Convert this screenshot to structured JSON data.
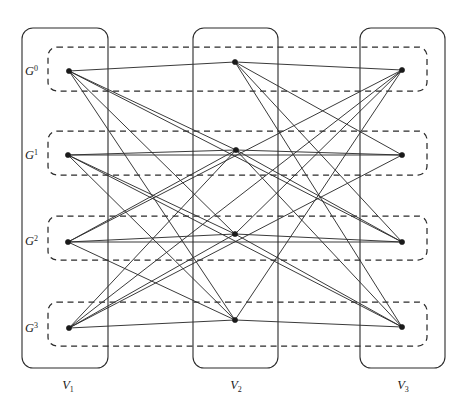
{
  "figure": {
    "width": 471,
    "height": 414,
    "background": "#ffffff",
    "stroke_color": "#2b2b2b",
    "edge_color": "#2f2f2f",
    "node_color": "#1a1a1a"
  },
  "columns": [
    {
      "id": "V1",
      "label": "V",
      "sub": "1",
      "x": 22,
      "y": 28,
      "w": 86,
      "h": 340,
      "label_x": 68,
      "label_y": 389,
      "node_x": 69
    },
    {
      "id": "V2",
      "label": "V",
      "sub": "2",
      "x": 193,
      "y": 28,
      "w": 85,
      "h": 340,
      "label_x": 236,
      "label_y": 389,
      "node_x": 235
    },
    {
      "id": "V3",
      "label": "V",
      "sub": "3",
      "x": 360,
      "y": 28,
      "w": 85,
      "h": 340,
      "label_x": 403,
      "label_y": 389,
      "node_x": 402
    }
  ],
  "layers": [
    {
      "id": "G0",
      "label": "G",
      "sup": "0",
      "x": 48,
      "y": 47,
      "w": 379,
      "h": 44,
      "label_x": 25,
      "label_y": 75,
      "y_v1": 71,
      "y_v2": 62,
      "y_v3": 70
    },
    {
      "id": "G1",
      "label": "G",
      "sup": "1",
      "x": 48,
      "y": 131,
      "w": 379,
      "h": 44,
      "label_x": 25,
      "label_y": 159,
      "y_v1": 155,
      "y_v2": 150,
      "y_v3": 155
    },
    {
      "id": "G2",
      "label": "G",
      "sup": "2",
      "x": 48,
      "y": 216,
      "w": 379,
      "h": 44,
      "label_x": 25,
      "label_y": 245,
      "y_v1": 242,
      "y_v2": 234,
      "y_v3": 242
    },
    {
      "id": "G3",
      "label": "G",
      "sup": "3",
      "x": 48,
      "y": 302,
      "w": 379,
      "h": 44,
      "label_x": 25,
      "label_y": 332,
      "y_v1": 328,
      "y_v2": 320,
      "y_v3": 327
    }
  ],
  "nodes": [
    {
      "id": "v1-g0",
      "column": "V1",
      "layer": "G0",
      "x": 69,
      "y": 71
    },
    {
      "id": "v1-g1",
      "column": "V1",
      "layer": "G1",
      "x": 68,
      "y": 155
    },
    {
      "id": "v1-g2",
      "column": "V1",
      "layer": "G2",
      "x": 68,
      "y": 242
    },
    {
      "id": "v1-g3",
      "column": "V1",
      "layer": "G3",
      "x": 69,
      "y": 328
    },
    {
      "id": "v2-g0",
      "column": "V2",
      "layer": "G0",
      "x": 235,
      "y": 62
    },
    {
      "id": "v2-g1",
      "column": "V2",
      "layer": "G1",
      "x": 236,
      "y": 150
    },
    {
      "id": "v2-g2",
      "column": "V2",
      "layer": "G2",
      "x": 235,
      "y": 234
    },
    {
      "id": "v2-g3",
      "column": "V2",
      "layer": "G3",
      "x": 235,
      "y": 320
    },
    {
      "id": "v3-g0",
      "column": "V3",
      "layer": "G0",
      "x": 402,
      "y": 70
    },
    {
      "id": "v3-g1",
      "column": "V3",
      "layer": "G1",
      "x": 402,
      "y": 155
    },
    {
      "id": "v3-g2",
      "column": "V3",
      "layer": "G2",
      "x": 402,
      "y": 242
    },
    {
      "id": "v3-g3",
      "column": "V3",
      "layer": "G3",
      "x": 402,
      "y": 327
    }
  ],
  "edges": [
    {
      "from": "v1-g0",
      "to": "v2-g0"
    },
    {
      "from": "v1-g0",
      "to": "v2-g1"
    },
    {
      "from": "v1-g0",
      "to": "v2-g2"
    },
    {
      "from": "v1-g0",
      "to": "v2-g3"
    },
    {
      "from": "v1-g0",
      "to": "v3-g2"
    },
    {
      "from": "v1-g1",
      "to": "v2-g1"
    },
    {
      "from": "v1-g1",
      "to": "v2-g2"
    },
    {
      "from": "v1-g1",
      "to": "v2-g3"
    },
    {
      "from": "v1-g1",
      "to": "v3-g1"
    },
    {
      "from": "v1-g1",
      "to": "v3-g3"
    },
    {
      "from": "v1-g2",
      "to": "v2-g1"
    },
    {
      "from": "v1-g2",
      "to": "v2-g2"
    },
    {
      "from": "v1-g2",
      "to": "v2-g3"
    },
    {
      "from": "v1-g2",
      "to": "v3-g0"
    },
    {
      "from": "v1-g2",
      "to": "v3-g2"
    },
    {
      "from": "v1-g3",
      "to": "v2-g1"
    },
    {
      "from": "v1-g3",
      "to": "v2-g2"
    },
    {
      "from": "v1-g3",
      "to": "v2-g3"
    },
    {
      "from": "v1-g3",
      "to": "v3-g0"
    },
    {
      "from": "v1-g3",
      "to": "v3-g1"
    },
    {
      "from": "v2-g0",
      "to": "v3-g0"
    },
    {
      "from": "v2-g0",
      "to": "v3-g1"
    },
    {
      "from": "v2-g0",
      "to": "v3-g2"
    },
    {
      "from": "v2-g0",
      "to": "v3-g3"
    },
    {
      "from": "v2-g1",
      "to": "v3-g1"
    },
    {
      "from": "v2-g1",
      "to": "v3-g2"
    },
    {
      "from": "v2-g1",
      "to": "v3-g3"
    },
    {
      "from": "v2-g2",
      "to": "v3-g0"
    },
    {
      "from": "v2-g2",
      "to": "v3-g2"
    },
    {
      "from": "v2-g2",
      "to": "v3-g3"
    },
    {
      "from": "v2-g3",
      "to": "v3-g0"
    },
    {
      "from": "v2-g3",
      "to": "v3-g3"
    }
  ]
}
